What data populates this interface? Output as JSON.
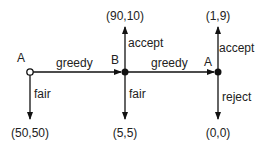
{
  "diagram": {
    "type": "game-tree",
    "nodes": [
      {
        "id": "n1",
        "player": "A",
        "style": "open",
        "x": 30,
        "y": 72
      },
      {
        "id": "n2",
        "player": "B",
        "style": "filled",
        "x": 125,
        "y": 72
      },
      {
        "id": "n3",
        "player": "A",
        "style": "filled",
        "x": 218,
        "y": 72
      }
    ],
    "edges": [
      {
        "from": "n1",
        "to": "n2",
        "label": "greedy"
      },
      {
        "from": "n2",
        "to": "n3",
        "label": "greedy"
      },
      {
        "from": "n1",
        "to": "payoff1",
        "label": "fair"
      },
      {
        "from": "n2",
        "to": "payoff2",
        "label": "accept"
      },
      {
        "from": "n2",
        "to": "payoff3",
        "label": "fair"
      },
      {
        "from": "n3",
        "to": "payoff4",
        "label": "accept"
      },
      {
        "from": "n3",
        "to": "payoff5",
        "label": "reject"
      }
    ],
    "payoffs": {
      "p1": "(50,50)",
      "p2": "(90,10)",
      "p3": "(5,5)",
      "p4": "(1,9)",
      "p5": "(0,0)"
    },
    "labels": {
      "n1_player": "A",
      "n2_player": "B",
      "n3_player": "A",
      "greedy1": "greedy",
      "greedy2": "greedy",
      "fair1": "fair",
      "fair2": "fair",
      "accept1": "accept",
      "accept2": "accept",
      "reject": "reject"
    }
  }
}
